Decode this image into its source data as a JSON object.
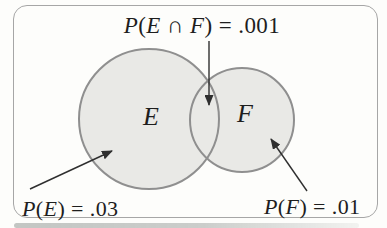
{
  "figure": {
    "kind": "venn-diagram",
    "sets": [
      {
        "label": "E",
        "probability_text": "P(E) = .03",
        "probability": 0.03
      },
      {
        "label": "F",
        "probability_text": "P(F) = .01",
        "probability": 0.01
      }
    ],
    "intersection": {
      "probability_text": "P(E ∩ F) = .001",
      "probability": 0.001
    },
    "colors": {
      "circle_fill": "#e9e9e6",
      "circle_stroke": "#8f8f8f",
      "frame_border": "#a6a6a6",
      "arrow": "#2f2f2f",
      "text": "#1e1e1e"
    }
  }
}
